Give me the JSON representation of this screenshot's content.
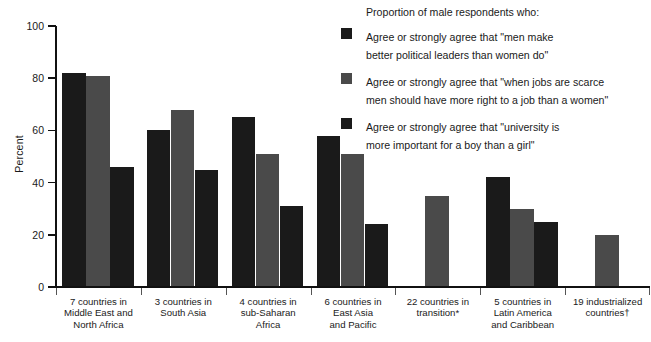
{
  "chart_data": {
    "type": "bar",
    "title": "",
    "xlabel": "",
    "ylabel": "Percent",
    "ylim": [
      0,
      100
    ],
    "yticks": [
      0,
      20,
      40,
      60,
      80,
      100
    ],
    "grid": false,
    "legend_position": "top-right",
    "legend_title": "Proportion of male respondents who:",
    "categories": [
      "7 countries in\nMiddle East and\nNorth Africa",
      "3 countries in\nSouth Asia",
      "4 countries in\nsub-Saharan\nAfrica",
      "6 countries in\nEast Asia\nand Pacific",
      "22 countries in\ntransition*",
      "5 countries in\nLatin America\nand Caribbean",
      "19 industrialized\ncountries†"
    ],
    "series": [
      {
        "name": "Agree or strongly agree that \"men make\nbetter political leaders than women do\"",
        "color": "#1a1a1a",
        "values": [
          82,
          60,
          65,
          58,
          null,
          42,
          null
        ]
      },
      {
        "name": "Agree or strongly agree that \"when jobs are scarce\nmen should have more right to a job than a women\"",
        "color": "#4a4a4a",
        "values": [
          81,
          68,
          51,
          51,
          35,
          30,
          20
        ]
      },
      {
        "name": "Agree or strongly agree that \"university is\nmore important for a boy than a girl\"",
        "color": "#1a1a1a",
        "values": [
          46,
          45,
          31,
          24,
          null,
          25,
          null
        ]
      }
    ]
  }
}
